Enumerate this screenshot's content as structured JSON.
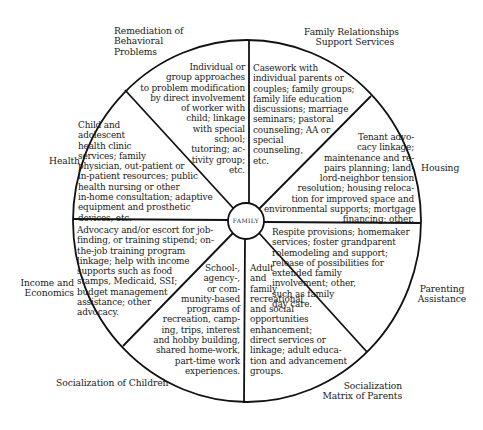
{
  "diagram": {
    "center": "FAMILY",
    "outer_labels": {
      "remediation": "Remediation of\nBehavioral\nProblems",
      "family_relationships": "Family Relationships\nSupport Services",
      "health": "Health",
      "housing": "Housing",
      "income": "Income and\nEconomics",
      "parenting": "Parenting\nAssistance",
      "socialization_children": "Socialization of Children",
      "socialization_parents": "Socialization\nMatrix of Parents"
    },
    "segments": {
      "remediation": "Individual or\ngroup approaches\nto problem modification\nby direct involvement\nof worker with\nchild; linkage\nwith special\nschool;\ntutoring; ac-\ntivity group;\netc.",
      "family_relationships": "Casework with\nindividual parents or\ncouples; family groups;\nfamily life education\ndiscussions; marriage\nseminars; pastoral\ncounseling; AA or\nspecial\ncounseling,\netc.",
      "health": "Child and\nadolescent\nhealth clinic\nservices; family\nphysician, out-patient or\nin-patient resources; public\nhealth nursing or other\nin-home consultation; adaptive\nequipment and prosthetic\ndevices, etc.",
      "housing": "Tenant advo-\ncacy linkage;\nmaintenance and re-\npairs planning; land-\nlord-neighbor tension\nresolution; housing reloca-\ntion for improved space and\nenvironmental supports; mortgage\nfinancing; other.",
      "income": "Advocacy and/or escort for job-\nfinding, or training stipend; on-\nthe-job training program\nlinkage; help with income\nsupports such as food\nstamps, Medicaid, SSI;\nbudget management\nassistance; other\nadvocacy.",
      "parenting": "Respite provisions; homemaker\nservices; foster grandparent\nrolemodeling and support;\nrelease of possibilities for\nextended family\ninvolvement; other,\nsuch as family\nday care.",
      "socialization_children": "School-,\nagency-,\nor com-\nmunity-based\nprograms of\nrecreation, camp-\ning, trips, interest\nand hobby building,\nshared home-work,\npart-time work\nexperiences.",
      "socialization_parents": "Adult\nand\nfamily\nrecreational\nand social\nopportunities\nenhancement;\ndirect services or\nlinkage; adult educa-\ntion and advancement\ngroups."
    },
    "colors": {
      "line": "#111111",
      "background": "#ffffff",
      "text": "#1a1a1a"
    }
  }
}
